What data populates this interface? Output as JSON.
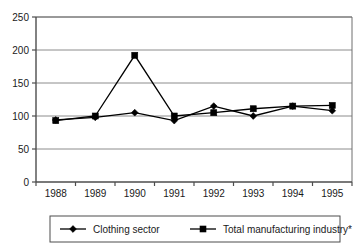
{
  "chart_data": {
    "type": "line",
    "title": "",
    "xlabel": "",
    "ylabel": "",
    "categories": [
      "1988",
      "1989",
      "1990",
      "1991",
      "1992",
      "1993",
      "1994",
      "1995"
    ],
    "x": [
      1988,
      1989,
      1990,
      1991,
      1992,
      1993,
      1994,
      1995
    ],
    "series": [
      {
        "name": "Clothing sector",
        "marker": "diamond",
        "color": "#000000",
        "values": [
          94,
          98,
          105,
          93,
          115,
          100,
          115,
          108
        ]
      },
      {
        "name": "Total manufacturing industry*",
        "marker": "square",
        "color": "#000000",
        "values": [
          93,
          100,
          192,
          100,
          105,
          111,
          115,
          116
        ]
      }
    ],
    "ylim": [
      0,
      250
    ],
    "yticks": [
      0,
      50,
      100,
      150,
      200,
      250
    ],
    "ytick_labels": [
      "0",
      "50",
      "100",
      "150",
      "200",
      "250"
    ],
    "grid": "horizontal",
    "legend_position": "bottom"
  },
  "legend": {
    "entries": [
      {
        "label": "Clothing sector",
        "marker": "diamond"
      },
      {
        "label": "Total manufacturing industry*",
        "marker": "square"
      }
    ]
  }
}
